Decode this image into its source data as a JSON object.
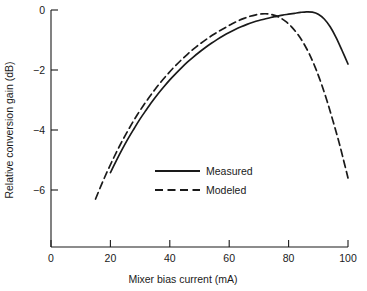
{
  "chart_data": {
    "type": "line",
    "title": "",
    "subtitle": "",
    "xlabel": "Mixer bias current (mA)",
    "ylabel": "Relative conversion gain (dB)",
    "xlim": [
      0,
      100
    ],
    "ylim": [
      -7.6,
      0.6
    ],
    "grid": false,
    "legend_position": "center",
    "xticks": [
      {
        "value": 0,
        "label": "0"
      },
      {
        "value": 20,
        "label": "20"
      },
      {
        "value": 40,
        "label": "40"
      },
      {
        "value": 60,
        "label": "60"
      },
      {
        "value": 80,
        "label": "80"
      },
      {
        "value": 100,
        "label": "100"
      }
    ],
    "yticks": [
      {
        "value": 0,
        "label": "0"
      },
      {
        "value": -2,
        "label": "−2"
      },
      {
        "value": -4,
        "label": "−4"
      },
      {
        "value": -6,
        "label": "−6"
      }
    ],
    "series": [
      {
        "name": "Measured",
        "style": "solid",
        "color": "#1a1a1a",
        "points": [
          [
            20.0,
            -5.42
          ],
          [
            22.0,
            -5.02
          ],
          [
            24.0,
            -4.64
          ],
          [
            26.0,
            -4.28
          ],
          [
            28.0,
            -3.95
          ],
          [
            30.0,
            -3.63
          ],
          [
            32.0,
            -3.34
          ],
          [
            34.0,
            -3.06
          ],
          [
            36.0,
            -2.8
          ],
          [
            38.0,
            -2.56
          ],
          [
            40.0,
            -2.33
          ],
          [
            42.0,
            -2.12
          ],
          [
            44.0,
            -1.92
          ],
          [
            46.0,
            -1.73
          ],
          [
            48.0,
            -1.56
          ],
          [
            50.0,
            -1.4
          ],
          [
            52.0,
            -1.25
          ],
          [
            54.0,
            -1.11
          ],
          [
            56.0,
            -0.98
          ],
          [
            58.0,
            -0.86
          ],
          [
            60.0,
            -0.75
          ],
          [
            62.0,
            -0.65
          ],
          [
            64.0,
            -0.56
          ],
          [
            66.0,
            -0.48
          ],
          [
            68.0,
            -0.41
          ],
          [
            70.0,
            -0.35
          ],
          [
            72.0,
            -0.3
          ],
          [
            74.0,
            -0.25
          ],
          [
            76.0,
            -0.21
          ],
          [
            78.0,
            -0.17
          ],
          [
            80.0,
            -0.14
          ],
          [
            82.0,
            -0.11
          ],
          [
            84.0,
            -0.08
          ],
          [
            86.0,
            -0.06
          ],
          [
            88.0,
            -0.07
          ],
          [
            90.0,
            -0.14
          ],
          [
            92.0,
            -0.3
          ],
          [
            94.0,
            -0.56
          ],
          [
            96.0,
            -0.92
          ],
          [
            98.0,
            -1.35
          ],
          [
            100.0,
            -1.8
          ]
        ]
      },
      {
        "name": "Modeled",
        "style": "dashed",
        "color": "#1a1a1a",
        "points": [
          [
            15.0,
            -6.3
          ],
          [
            17.0,
            -5.82
          ],
          [
            19.0,
            -5.37
          ],
          [
            21.0,
            -4.95
          ],
          [
            23.0,
            -4.55
          ],
          [
            25.0,
            -4.18
          ],
          [
            27.0,
            -3.83
          ],
          [
            29.0,
            -3.5
          ],
          [
            31.0,
            -3.2
          ],
          [
            33.0,
            -2.92
          ],
          [
            35.0,
            -2.65
          ],
          [
            37.0,
            -2.4
          ],
          [
            39.0,
            -2.17
          ],
          [
            41.0,
            -1.95
          ],
          [
            43.0,
            -1.75
          ],
          [
            45.0,
            -1.56
          ],
          [
            47.0,
            -1.38
          ],
          [
            49.0,
            -1.22
          ],
          [
            51.0,
            -1.07
          ],
          [
            53.0,
            -0.93
          ],
          [
            55.0,
            -0.8
          ],
          [
            57.0,
            -0.68
          ],
          [
            59.0,
            -0.57
          ],
          [
            61.0,
            -0.46
          ],
          [
            63.0,
            -0.36
          ],
          [
            65.0,
            -0.28
          ],
          [
            67.0,
            -0.21
          ],
          [
            69.0,
            -0.16
          ],
          [
            71.0,
            -0.13
          ],
          [
            73.0,
            -0.13
          ],
          [
            75.0,
            -0.17
          ],
          [
            77.0,
            -0.25
          ],
          [
            79.0,
            -0.38
          ],
          [
            81.0,
            -0.56
          ],
          [
            83.0,
            -0.8
          ],
          [
            85.0,
            -1.1
          ],
          [
            87.0,
            -1.47
          ],
          [
            89.0,
            -1.92
          ],
          [
            91.0,
            -2.45
          ],
          [
            93.0,
            -3.05
          ],
          [
            95.0,
            -3.72
          ],
          [
            97.0,
            -4.42
          ],
          [
            99.0,
            -5.2
          ],
          [
            100.0,
            -5.6
          ]
        ]
      }
    ],
    "legend": [
      {
        "label": "Measured",
        "style": "solid"
      },
      {
        "label": "Modeled",
        "style": "dashed"
      }
    ],
    "annotations": []
  }
}
